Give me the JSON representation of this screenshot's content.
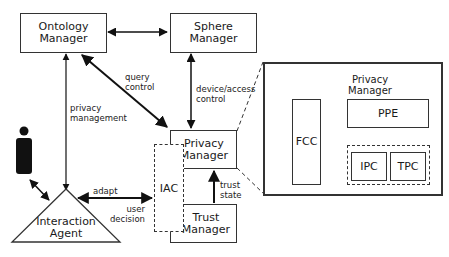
{
  "diagram": {
    "nodes": {
      "ontology_manager": "Ontology\nManager",
      "sphere_manager": "Sphere\nManager",
      "privacy_manager": "Privacy\nManager",
      "trust_manager": "Trust\nManager",
      "iac": "IAC",
      "interaction_agent": "Interaction\nAgent",
      "user": "user-figure-icon"
    },
    "detail": {
      "title": "Privacy\nManager",
      "fcc": "FCC",
      "ppe": "PPE",
      "ipc": "IPC",
      "tpc": "TPC"
    },
    "edges": {
      "query_control": "query\ncontrol",
      "device_access_control": "device/access\ncontrol",
      "privacy_management": "privacy\nmanagement",
      "adapt": "adapt",
      "user_decision": "user\ndecision",
      "trust_state": "trust\nstate"
    },
    "colors": {
      "stroke": "#333333",
      "fill": "#ffffff",
      "user_figure": "#111111"
    }
  }
}
